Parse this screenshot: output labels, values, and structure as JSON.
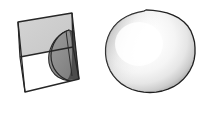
{
  "figure": {
    "type": "geometry-illustration",
    "background_color": "#ffffff",
    "width": 204,
    "height": 120,
    "panels": [
      {
        "name": "cube-with-spherical-wedge",
        "label": "",
        "description": "Tilted 3D box containing a shaded quarter-sphere wedge",
        "stroke_color": "#262626",
        "faces": [
          {
            "name": "top-face",
            "fill": "#cfcfcf"
          },
          {
            "name": "front-face",
            "fill": "#ffffff"
          },
          {
            "name": "right-face",
            "fill": "#3a3a3a"
          }
        ],
        "wedge": {
          "name": "spherical-wedge",
          "fill": "#8c8c8c",
          "shadow_fill": "#4a4a4a"
        }
      },
      {
        "name": "shaded-sphere",
        "label": "",
        "description": "Faceted sphere with smooth grayscale shading and highlight",
        "stroke_color": "#1f1f1f",
        "fill_light": "#ffffff",
        "fill_mid": "#ededed",
        "fill_dark": "#9a9a9a",
        "highlight_x_pct": 38,
        "highlight_y_pct": 36,
        "facet_count": 40,
        "center_x": 146,
        "center_y": 60,
        "radius_x": 47,
        "radius_y": 50
      }
    ]
  }
}
